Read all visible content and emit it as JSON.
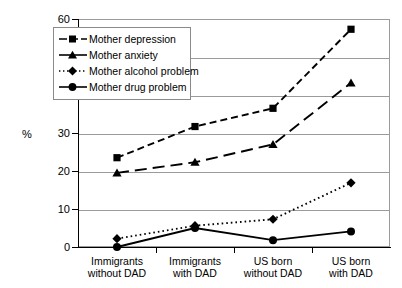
{
  "chart_data": {
    "type": "line",
    "title": "",
    "xlabel": "",
    "ylabel": "%",
    "ylim": [
      0,
      60
    ],
    "yticks": [
      0,
      10,
      20,
      30,
      40,
      50,
      60
    ],
    "grid": "horizontal",
    "legend_position": "upper-left-inside",
    "categories": [
      "Immigrants without DAD",
      "Immigrants with DAD",
      "US born without DAD",
      "US born with DAD"
    ],
    "category_lines": [
      [
        "Immigrants",
        "without DAD"
      ],
      [
        "Immigrants",
        "with DAD"
      ],
      [
        "US born",
        "without DAD"
      ],
      [
        "US born",
        "with DAD"
      ]
    ],
    "series": [
      {
        "name": "Mother depression",
        "marker": "square",
        "line_style": "dashed",
        "color": "#000000",
        "values": [
          23.5,
          31.7,
          36.5,
          57.3
        ]
      },
      {
        "name": "Mother anxiety",
        "marker": "triangle",
        "line_style": "long-dash",
        "color": "#000000",
        "values": [
          19.5,
          22.3,
          27.0,
          43.2
        ]
      },
      {
        "name": "Mother alcohol problem",
        "marker": "diamond",
        "line_style": "dotted",
        "color": "#000000",
        "values": [
          2.2,
          5.6,
          7.3,
          16.9
        ]
      },
      {
        "name": "Mother drug problem",
        "marker": "circle",
        "line_style": "solid",
        "color": "#000000",
        "values": [
          0.0,
          5.0,
          1.8,
          4.1
        ]
      }
    ]
  },
  "axis": {
    "y_title": "%",
    "y_tick_labels": [
      "60",
      "50",
      "40",
      "30",
      "20",
      "10",
      "0"
    ]
  },
  "legend": {
    "items": [
      {
        "label": "Mother depression"
      },
      {
        "label": "Mother anxiety"
      },
      {
        "label": "Mother alcohol problem"
      },
      {
        "label": "Mother drug problem"
      }
    ]
  }
}
